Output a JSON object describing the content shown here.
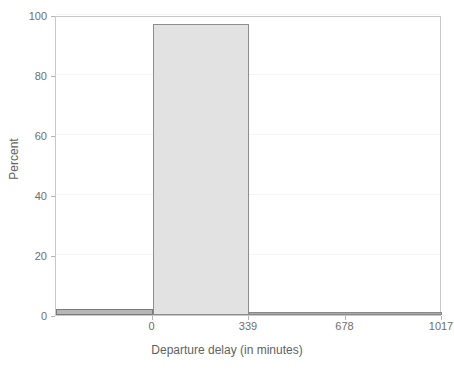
{
  "chart_data": {
    "type": "bar",
    "title": "",
    "subtitle": "",
    "xlabel": "Departure delay (in minutes)",
    "ylabel": "Percent",
    "xlim": [
      -339,
      1017
    ],
    "ylim": [
      0,
      100
    ],
    "grid": true,
    "legend": null,
    "xticks": [
      {
        "value": 0,
        "label": "0"
      },
      {
        "value": 339,
        "label": "339"
      },
      {
        "value": 678,
        "label": "678"
      },
      {
        "value": 1017,
        "label": "1017"
      }
    ],
    "yticks": [
      {
        "value": 0,
        "label": "0"
      },
      {
        "value": 20,
        "label": "20"
      },
      {
        "value": 40,
        "label": "40"
      },
      {
        "value": 60,
        "label": "60"
      },
      {
        "value": 80,
        "label": "80"
      },
      {
        "value": 100,
        "label": "100"
      }
    ],
    "bins": [
      {
        "x0": -339,
        "x1": 0,
        "value": 2.0
      },
      {
        "x0": 0,
        "x1": 339,
        "value": 97.0
      },
      {
        "x0": 339,
        "x1": 1017,
        "value": 0.4
      }
    ],
    "colors": {
      "bar_fill_main": "#e2e2e2",
      "bar_edge_main": "#8d8d8d",
      "bar_fill_small": "#b6b6b6",
      "bar_edge_small": "#7a7a7a",
      "axis": "#c9c9c9",
      "gridline": "#f4f4f4",
      "tick_text": "#6e6e6e",
      "label_text": "#5f5f5f",
      "background": "#ffffff"
    }
  }
}
